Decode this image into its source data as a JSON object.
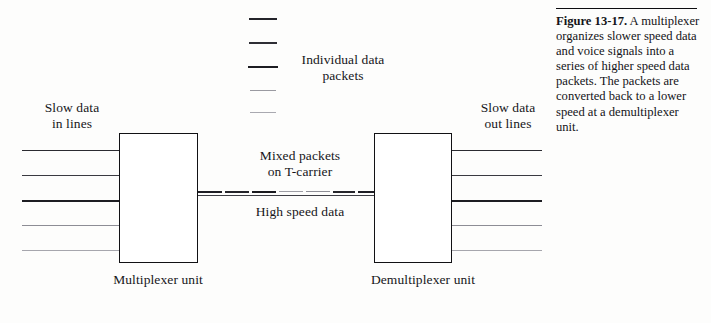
{
  "figure": {
    "caption_title": "Figure 13-17.",
    "caption_body": "A multiplexer organizes slower speed data and voice signals into a series of higher speed data packets. The packets are converted back to a lower speed at a demultiplexer unit.",
    "rule_color": "#0d0d10"
  },
  "labels": {
    "slow_data_in": "Slow data\nin lines",
    "slow_data_out": "Slow data\nout lines",
    "individual_packets": "Individual data\npackets",
    "mixed_packets": "Mixed packets\non T-carrier",
    "high_speed_data": "High speed data",
    "multiplexer_unit": "Multiplexer unit",
    "demultiplexer_unit": "Demultiplexer unit"
  },
  "units": {
    "multiplexer": {
      "x": 119,
      "y": 133,
      "width": 79,
      "height": 130
    },
    "demultiplexer": {
      "x": 374,
      "y": 133,
      "width": 78,
      "height": 130
    }
  },
  "input_lines": [
    {
      "y": 150,
      "x": 22,
      "width": 100,
      "color": "#2b2b31",
      "thickness": 1.8
    },
    {
      "y": 175,
      "x": 22,
      "width": 100,
      "color": "#3a3a41",
      "thickness": 1.5
    },
    {
      "y": 200,
      "x": 22,
      "width": 100,
      "color": "#1d1d22",
      "thickness": 2.0
    },
    {
      "y": 225,
      "x": 22,
      "width": 100,
      "color": "#8d8d95",
      "thickness": 1.2
    },
    {
      "y": 250,
      "x": 22,
      "width": 100,
      "color": "#a6a6ad",
      "thickness": 1.1
    }
  ],
  "output_lines": [
    {
      "y": 150,
      "x": 452,
      "width": 90,
      "color": "#2b2b31",
      "thickness": 1.8
    },
    {
      "y": 175,
      "x": 452,
      "width": 90,
      "color": "#3a3a41",
      "thickness": 1.5
    },
    {
      "y": 200,
      "x": 452,
      "width": 90,
      "color": "#1d1d22",
      "thickness": 2.0
    },
    {
      "y": 225,
      "x": 452,
      "width": 90,
      "color": "#8d8d95",
      "thickness": 1.2
    },
    {
      "y": 250,
      "x": 452,
      "width": 90,
      "color": "#a6a6ad",
      "thickness": 1.1
    }
  ],
  "packet_swatches": [
    {
      "y": 18,
      "x": 249,
      "width": 28,
      "color": "#24242a",
      "thickness": 2.2
    },
    {
      "y": 42,
      "x": 249,
      "width": 28,
      "color": "#2e2e35",
      "thickness": 2.0
    },
    {
      "y": 66,
      "x": 248,
      "width": 30,
      "color": "#1d1d22",
      "thickness": 2.4
    },
    {
      "y": 90,
      "x": 250,
      "width": 26,
      "color": "#9a9aa1",
      "thickness": 1.5
    },
    {
      "y": 112,
      "x": 250,
      "width": 26,
      "color": "#a9a9b0",
      "thickness": 1.3
    }
  ],
  "tcarrier": {
    "y": 191,
    "x": 198,
    "total_width": 176,
    "segments": [
      {
        "offset": 0,
        "width": 24,
        "color": "#1f1f25",
        "thickness": 2.4
      },
      {
        "offset": 27,
        "width": 24,
        "color": "#24242a",
        "thickness": 2.3
      },
      {
        "offset": 54,
        "width": 24,
        "color": "#1a1a1f",
        "thickness": 2.5
      },
      {
        "offset": 81,
        "width": 24,
        "color": "#9d9da4",
        "thickness": 1.6
      },
      {
        "offset": 108,
        "width": 24,
        "color": "#8e8e96",
        "thickness": 1.7
      },
      {
        "offset": 135,
        "width": 22,
        "color": "#26262c",
        "thickness": 2.2
      },
      {
        "offset": 160,
        "width": 16,
        "color": "#1f1f25",
        "thickness": 2.3
      }
    ]
  }
}
